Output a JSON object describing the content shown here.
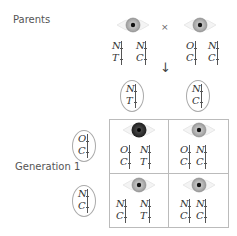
{
  "labels": {
    "parents": "Parents",
    "generation1": "Generation 1",
    "cross": "×",
    "arrow": "↓"
  },
  "colors": {
    "eye_light_iris": "#a9a9a9",
    "eye_dark_iris": "#2b2b2b",
    "border": "#bbbbbb"
  },
  "parents": [
    {
      "eye": "light",
      "pairs": [
        [
          "N",
          "T"
        ],
        [
          "N",
          "C"
        ]
      ]
    },
    {
      "eye": "light",
      "pairs": [
        [
          "O",
          "C"
        ],
        [
          "N",
          "C"
        ]
      ]
    }
  ],
  "gametes_top": [
    [
      "N",
      "T"
    ],
    [
      "N",
      "C"
    ]
  ],
  "gametes_left": [
    [
      "O",
      "C"
    ],
    [
      "N",
      "C"
    ]
  ],
  "offspring": [
    {
      "eye": "dark",
      "pairs": [
        [
          "O",
          "C"
        ],
        [
          "N",
          "T"
        ]
      ]
    },
    {
      "eye": "light",
      "pairs": [
        [
          "O",
          "C"
        ],
        [
          "N",
          "C"
        ]
      ]
    },
    {
      "eye": "light",
      "pairs": [
        [
          "N",
          "C"
        ],
        [
          "N",
          "T"
        ]
      ]
    },
    {
      "eye": "light",
      "pairs": [
        [
          "N",
          "C"
        ],
        [
          "N",
          "C"
        ]
      ]
    }
  ]
}
